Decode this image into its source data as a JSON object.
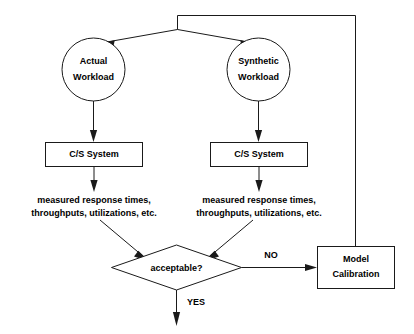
{
  "diagram": {
    "colors": {
      "stroke": "#1a1a1a",
      "fill": "#ffffff",
      "text": "#000000",
      "background": "#ffffff"
    },
    "nodes": {
      "actual_workload": {
        "shape": "circle",
        "line1": "Actual",
        "line2": "Workload"
      },
      "synthetic_workload": {
        "shape": "circle",
        "line1": "Synthetic",
        "line2": "Workload"
      },
      "cs_system_left": {
        "shape": "rectangle",
        "label": "C/S System"
      },
      "cs_system_right": {
        "shape": "rectangle",
        "label": "C/S System"
      },
      "measured_left": {
        "shape": "text",
        "line1": "measured response times,",
        "line2": "throughputs, utilizations, etc."
      },
      "measured_right": {
        "shape": "text",
        "line1": "measured response times,",
        "line2": "throughputs, utilizations, etc."
      },
      "decision": {
        "shape": "diamond",
        "label": "acceptable?"
      },
      "model_calibration": {
        "shape": "rectangle",
        "line1": "Model",
        "line2": "Calibration"
      }
    },
    "edge_labels": {
      "no": "NO",
      "yes": "YES"
    }
  }
}
